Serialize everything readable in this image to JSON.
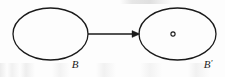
{
  "figure": {
    "kind": "math-diagram",
    "background_color": "#fdfdfd",
    "stroke_color": "#1a1a1a",
    "canvas": {
      "width": 225,
      "height": 77
    },
    "shapes": {
      "source_ellipse": {
        "name": "B",
        "cx": 50.5,
        "cy": 34,
        "rx": 37.5,
        "ry": 26,
        "stroke_width": 1.3,
        "fill": "none"
      },
      "target_ellipse": {
        "name": "B-prime",
        "cx": 177.5,
        "cy": 34,
        "rx": 38.5,
        "ry": 26,
        "stroke_width": 1.3,
        "fill": "none"
      },
      "point_marker": {
        "name": "interior-point",
        "cx": 173,
        "cy": 34,
        "r": 2.1,
        "stroke_width": 1.1,
        "fill": "none"
      },
      "arrow": {
        "x1": 88,
        "y1": 34,
        "x2": 140,
        "y2": 34,
        "stroke_width": 1.6,
        "head_length": 8,
        "head_half_width": 3.4,
        "head_filled": true
      }
    },
    "labels": {
      "source": {
        "text": "B",
        "prime": "",
        "x": 75,
        "y": 68,
        "style": "italic-serif"
      },
      "target": {
        "text": "B",
        "prime": "′",
        "x": 205,
        "y": 68,
        "style": "italic-serif"
      }
    }
  }
}
